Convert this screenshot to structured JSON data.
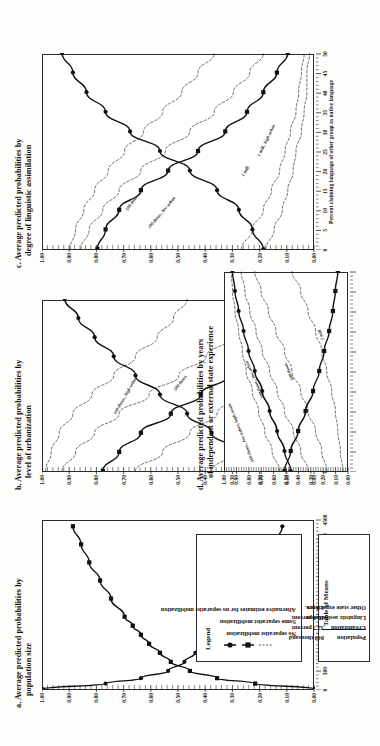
{
  "figure": {
    "orientation": "rotated-90-ccw",
    "ink_color": "#111111",
    "panels": [
      "a",
      "b",
      "c",
      "d"
    ]
  },
  "panel_a": {
    "label": "a.",
    "title_line1": "Average predicted probabilities by",
    "title_line2": "population size",
    "xlabel": "Population size (thousands)",
    "ylabels": [
      "1.00",
      "0.90",
      "0.80",
      "0.70",
      "0.60",
      "0.50",
      "0.40",
      "0.30",
      "0.20",
      "0.10",
      "0.00"
    ],
    "xlabels": [
      "0",
      "500",
      "1000",
      "1500",
      "2000",
      "2500",
      "3000",
      "3500",
      "4000",
      "4500"
    ]
  },
  "panel_b": {
    "label": "b.",
    "title_line1": "Average predicted probabilities by",
    "title_line2": "level of urbanization",
    "xlabel": "Percent urban",
    "ylabels": [
      "1.00",
      "0.90",
      "0.80",
      "0.70",
      "0.60",
      "0.50",
      "0.40",
      "0.30",
      "0.20",
      "0.10",
      "0.00"
    ],
    "xlabels": [
      "0",
      "10",
      "20",
      "30",
      "40",
      "50",
      "60",
      "70",
      "80",
      "90"
    ],
    "curve_labels": [
      "100 thous., high urban",
      "500 thous.",
      "1 mill.",
      "1 mill., low urban"
    ]
  },
  "panel_c": {
    "label": "c.",
    "title_line1": "Average predicted probabilities by",
    "title_line2": "degree of linguistic assimilation",
    "xlabel": "Percent claiming language of other group as native language",
    "ylabels": [
      "1.00",
      "0.90",
      "0.80",
      "0.70",
      "0.60",
      "0.50",
      "0.40",
      "0.30",
      "0.20",
      "0.10",
      "0.00"
    ],
    "xlabels": [
      "0",
      "5",
      "10",
      "15",
      "20",
      "25",
      "30",
      "35",
      "40",
      "45",
      "50"
    ],
    "curve_labels": [
      "100 thous., low urban",
      "500 thous.",
      "1 mill.",
      "1 mill., high urban"
    ]
  },
  "panel_d": {
    "label": "d.",
    "title_line1": "Average predicted probabilities by years",
    "title_line2": "of independent or external state experience",
    "xlabel": "",
    "ylabels": [
      "1.00",
      "0.90",
      "0.80",
      "0.70",
      "0.60",
      "0.50",
      "0.40",
      "0.30",
      "0.20",
      "0.10",
      "0.00"
    ],
    "xlabels": [],
    "curve_labels": [
      "500 thous., low urban, high assim.",
      "500 thous., low urban",
      "500 thous.",
      "1 mill."
    ]
  },
  "legend": {
    "title": "Legend",
    "items": [
      {
        "marker": "solid-circle-line",
        "label": "No separatist mobilization"
      },
      {
        "marker": "solid-square-line",
        "label": "Some separatist mobilization"
      },
      {
        "marker": "dashed-line",
        "label": "Alternative estimates for no separatist mobilization"
      }
    ]
  },
  "table_of_means": {
    "title": "Table of Means",
    "rows": [
      {
        "name": "Population",
        "value": "840 thousand"
      },
      {
        "name": "Urbanization",
        "value": "32.7 percent"
      },
      {
        "name": "Linguistic assimilation",
        "value": "10.4 percent"
      },
      {
        "name": "Other state experience",
        "value": "1.5 yrs."
      }
    ]
  },
  "chart_data": [
    {
      "id": "a",
      "type": "line",
      "title": "a. Average predicted probabilities by population size",
      "xlabel": "Population size (thousands)",
      "ylabel": "",
      "xlim": [
        0,
        4700
      ],
      "ylim": [
        0,
        1
      ],
      "grid": false,
      "legend_position": "external",
      "x": [
        0,
        150,
        300,
        500,
        750,
        1000,
        1250,
        1500,
        1750,
        2000,
        2500,
        3000,
        3500,
        4000,
        4500
      ],
      "series": [
        {
          "name": "No separatist mobilization",
          "marker": "circle",
          "style": "solid",
          "values": [
            1.0,
            0.77,
            0.64,
            0.54,
            0.48,
            0.44,
            0.4,
            0.37,
            0.34,
            0.31,
            0.26,
            0.22,
            0.18,
            0.15,
            0.12
          ]
        },
        {
          "name": "Some separatist mobilization",
          "marker": "square",
          "style": "solid",
          "values": [
            0.0,
            0.22,
            0.36,
            0.46,
            0.53,
            0.57,
            0.61,
            0.64,
            0.67,
            0.7,
            0.75,
            0.79,
            0.83,
            0.86,
            0.89
          ]
        }
      ]
    },
    {
      "id": "b",
      "type": "line",
      "title": "b. Average predicted probabilities by level of urbanization",
      "xlabel": "Percent urban",
      "ylabel": "",
      "xlim": [
        0,
        90
      ],
      "ylim": [
        0,
        1
      ],
      "grid": false,
      "legend_position": "external",
      "x": [
        0,
        10,
        20,
        30,
        40,
        50,
        60,
        70,
        80,
        90
      ],
      "series": [
        {
          "name": "No separatist mobilization",
          "marker": "circle",
          "style": "solid",
          "values": [
            0.16,
            0.28,
            0.38,
            0.47,
            0.57,
            0.66,
            0.74,
            0.81,
            0.87,
            0.92
          ]
        },
        {
          "name": "Some separatist mobilization",
          "marker": "square",
          "style": "solid",
          "values": [
            0.78,
            0.72,
            0.64,
            0.53,
            0.42,
            0.32,
            0.24,
            0.18,
            0.13,
            0.1
          ]
        },
        {
          "name": "100 thous., high urban",
          "marker": "none",
          "style": "dashed",
          "values": [
            0.99,
            0.97,
            0.94,
            0.89,
            0.82,
            0.74,
            0.66,
            0.58,
            0.52,
            0.47
          ]
        },
        {
          "name": "500 thous.",
          "marker": "none",
          "style": "dashed",
          "values": [
            0.93,
            0.88,
            0.81,
            0.72,
            0.61,
            0.5,
            0.4,
            0.31,
            0.24,
            0.19
          ]
        },
        {
          "name": "1 mill.",
          "marker": "none",
          "style": "dashed",
          "values": [
            0.66,
            0.56,
            0.46,
            0.36,
            0.28,
            0.21,
            0.16,
            0.12,
            0.09,
            0.07
          ]
        },
        {
          "name": "1 mill., low urban",
          "marker": "none",
          "style": "dashed",
          "values": [
            0.38,
            0.3,
            0.23,
            0.17,
            0.13,
            0.1,
            0.07,
            0.05,
            0.04,
            0.03
          ]
        }
      ]
    },
    {
      "id": "c",
      "type": "line",
      "title": "c. Average predicted probabilities by degree of linguistic assimilation",
      "xlabel": "Percent claiming language of other group as native language",
      "ylabel": "",
      "xlim": [
        0,
        50
      ],
      "ylim": [
        0,
        1
      ],
      "grid": false,
      "legend_position": "external",
      "x": [
        0,
        5,
        10,
        15,
        20,
        25,
        30,
        35,
        40,
        45,
        50
      ],
      "series": [
        {
          "name": "No separatist mobilization",
          "marker": "circle",
          "style": "solid",
          "values": [
            0.19,
            0.23,
            0.28,
            0.36,
            0.46,
            0.57,
            0.68,
            0.77,
            0.84,
            0.89,
            0.93
          ]
        },
        {
          "name": "Some separatist mobilization",
          "marker": "square",
          "style": "solid",
          "values": [
            0.8,
            0.77,
            0.72,
            0.64,
            0.54,
            0.43,
            0.33,
            0.25,
            0.19,
            0.14,
            0.1
          ]
        },
        {
          "name": "100 thous., low urban",
          "marker": "none",
          "style": "dashed",
          "values": [
            0.9,
            0.88,
            0.85,
            0.81,
            0.76,
            0.7,
            0.63,
            0.56,
            0.49,
            0.43,
            0.37
          ]
        },
        {
          "name": "500 thous.",
          "marker": "none",
          "style": "dashed",
          "values": [
            0.86,
            0.83,
            0.78,
            0.72,
            0.64,
            0.55,
            0.46,
            0.37,
            0.3,
            0.24,
            0.19
          ]
        },
        {
          "name": "1 mill.",
          "marker": "none",
          "style": "dashed",
          "values": [
            0.27,
            0.23,
            0.19,
            0.16,
            0.13,
            0.11,
            0.09,
            0.07,
            0.06,
            0.05,
            0.04
          ]
        },
        {
          "name": "1 mill., high urban",
          "marker": "none",
          "style": "dashed",
          "values": [
            0.18,
            0.15,
            0.12,
            0.1,
            0.08,
            0.07,
            0.05,
            0.04,
            0.03,
            0.03,
            0.02
          ]
        }
      ]
    },
    {
      "id": "d",
      "type": "line",
      "title": "d. Average predicted probabilities by years of independent or external state experience",
      "xlabel": "",
      "ylabel": "",
      "xlim": [
        0,
        100
      ],
      "ylim": [
        0,
        1
      ],
      "grid": false,
      "legend_position": "external",
      "x": [
        0,
        10,
        20,
        30,
        40,
        50,
        60,
        70,
        80,
        90,
        100
      ],
      "series": [
        {
          "name": "No separatist mobilization",
          "marker": "circle",
          "style": "solid",
          "values": [
            0.47,
            0.52,
            0.58,
            0.64,
            0.7,
            0.76,
            0.81,
            0.85,
            0.89,
            0.92,
            0.94
          ]
        },
        {
          "name": "Some separatist mobilization",
          "marker": "square",
          "style": "solid",
          "values": [
            0.52,
            0.47,
            0.41,
            0.35,
            0.29,
            0.24,
            0.2,
            0.16,
            0.13,
            0.11,
            0.09
          ]
        },
        {
          "name": "500 thous., low urban, high assim.",
          "marker": "none",
          "style": "dashed",
          "values": [
            0.56,
            0.62,
            0.68,
            0.73,
            0.78,
            0.83,
            0.86,
            0.89,
            0.92,
            0.94,
            0.95
          ]
        },
        {
          "name": "500 thous., low urban",
          "marker": "none",
          "style": "dashed",
          "values": [
            0.33,
            0.39,
            0.45,
            0.52,
            0.58,
            0.64,
            0.7,
            0.75,
            0.8,
            0.84,
            0.87
          ]
        },
        {
          "name": "500 thous.",
          "marker": "none",
          "style": "dashed",
          "values": [
            0.18,
            0.22,
            0.27,
            0.33,
            0.39,
            0.46,
            0.52,
            0.59,
            0.65,
            0.71,
            0.76
          ]
        },
        {
          "name": "1 mill.",
          "marker": "none",
          "style": "dashed",
          "values": [
            0.05,
            0.07,
            0.09,
            0.11,
            0.14,
            0.18,
            0.22,
            0.27,
            0.33,
            0.39,
            0.46
          ]
        }
      ]
    }
  ]
}
